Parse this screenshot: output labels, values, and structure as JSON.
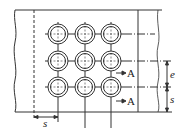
{
  "diagram": {
    "colors": {
      "line": "#333333",
      "background": "#ffffff"
    },
    "grid": {
      "columns_x": [
        58,
        85,
        111
      ],
      "rows_y": [
        34,
        61,
        87
      ],
      "outer_radius": 10,
      "inner_radius": 7.5
    },
    "labels": {
      "pitch_bottom": "s",
      "edge_distance": "e",
      "pitch_right": "s",
      "section_top": "A",
      "section_bottom": "A"
    }
  }
}
